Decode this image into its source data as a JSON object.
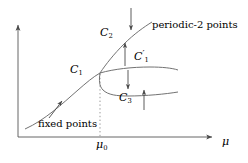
{
  "figure": {
    "background_color": "#ffffff",
    "stroke_color": "#555555",
    "text_color": "#000000",
    "dotted_line_color": "#999999",
    "width": 248,
    "height": 163
  },
  "axes": {
    "x_axis_label": "μ",
    "y_axis_label": "",
    "x_tick_label": "μ",
    "x_tick_sub": "0",
    "origin": {
      "x": 18,
      "y": 137
    },
    "x_end": {
      "x": 215,
      "y": 137
    },
    "y_end": {
      "x": 18,
      "y": 23
    }
  },
  "curves": {
    "c1": {
      "label": "C",
      "sub": "1",
      "prime": "",
      "name": "fixed-point-branch"
    },
    "c2": {
      "label": "C",
      "sub": "2",
      "prime": "",
      "name": "upper-periodic-2-branch"
    },
    "c1prime": {
      "label": "C",
      "sub": "1",
      "prime": "′",
      "name": "middle-branch"
    },
    "c3": {
      "label": "C",
      "sub": "3",
      "prime": "",
      "name": "lower-periodic-2-branch"
    }
  },
  "annotations": {
    "periodic_points": "periodic-2 points",
    "fixed_points": "fixed points",
    "mu0_tick": "μ",
    "mu0_sub": "0",
    "mu_axis": "μ"
  },
  "arrows": [
    {
      "name": "arrow-periodic-2-down",
      "direction": "down",
      "x": 131,
      "y1": 9,
      "y2": 31
    },
    {
      "name": "arrow-c1prime-up",
      "direction": "up",
      "x": 125,
      "y1": 66,
      "y2": 44
    },
    {
      "name": "arrow-c3-down",
      "direction": "down",
      "x": 127,
      "y1": 70,
      "y2": 90
    },
    {
      "name": "arrow-c3-right-up",
      "direction": "up",
      "x": 143,
      "y1": 108,
      "y2": 88
    },
    {
      "name": "arrow-fixed-points",
      "direction": "up-left",
      "x": 63,
      "y1": 119,
      "y2": 100
    }
  ]
}
